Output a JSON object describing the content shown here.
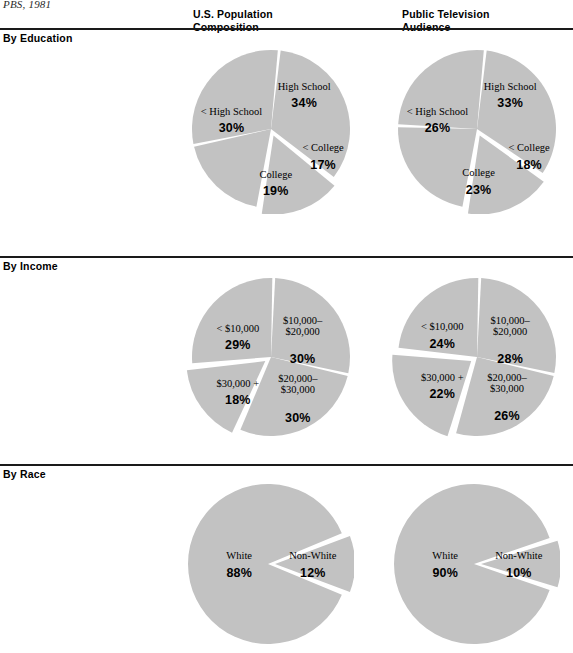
{
  "source_note": "PBS, 1981",
  "columns": [
    {
      "id": "us-population",
      "label": "U.S. Population\nComposition"
    },
    {
      "id": "public-tv",
      "label": "Public Television\nAudience"
    }
  ],
  "sections": [
    {
      "id": "education",
      "title": "By Education"
    },
    {
      "id": "income",
      "title": "By Income"
    },
    {
      "id": "race",
      "title": "By Race"
    }
  ],
  "colors": {
    "slice_fill": "#c2c2c2",
    "slice_gap": "#ffffff",
    "rule": "#1a1a1a",
    "text": "#000000",
    "background": "#ffffff"
  },
  "chart_data": [
    {
      "id": "education-us-population",
      "type": "pie",
      "section": "By Education",
      "column": "U.S. Population Composition",
      "labels": [
        "High School",
        "< College",
        "College",
        "< High School"
      ],
      "values": [
        34,
        17,
        19,
        30
      ],
      "value_labels": [
        "34%",
        "17%",
        "19%",
        "30%"
      ],
      "exploded": [
        false,
        true,
        false,
        false
      ],
      "start_angle": -84,
      "units": "percent"
    },
    {
      "id": "education-public-tv",
      "type": "pie",
      "section": "By Education",
      "column": "Public Television Audience",
      "labels": [
        "High School",
        "< College",
        "College",
        "< High School"
      ],
      "values": [
        33,
        18,
        23,
        26
      ],
      "value_labels": [
        "33%",
        "18%",
        "23%",
        "26%"
      ],
      "exploded": [
        false,
        true,
        false,
        false
      ],
      "start_angle": -84,
      "units": "percent"
    },
    {
      "id": "income-us-population",
      "type": "pie",
      "section": "By Income",
      "column": "U.S. Population Composition",
      "labels": [
        "$10,000–\n$20,000",
        "$20,000–\n$30,000",
        "$30,000 +",
        "< $10,000"
      ],
      "values": [
        30,
        30,
        18,
        29
      ],
      "value_labels": [
        "30%",
        "30%",
        "18%",
        "29%"
      ],
      "exploded": [
        false,
        false,
        true,
        false
      ],
      "start_angle": -88,
      "units": "percent"
    },
    {
      "id": "income-public-tv",
      "type": "pie",
      "section": "By Income",
      "column": "Public Television Audience",
      "labels": [
        "$10,000–\n$20,000",
        "$20,000–\n$30,000",
        "$30,000 +",
        "< $10,000"
      ],
      "values": [
        28,
        26,
        22,
        24
      ],
      "value_labels": [
        "28%",
        "26%",
        "22%",
        "24%"
      ],
      "exploded": [
        false,
        false,
        true,
        false
      ],
      "start_angle": -88,
      "units": "percent"
    },
    {
      "id": "race-us-population",
      "type": "pie",
      "section": "By Race",
      "column": "U.S. Population Composition",
      "labels": [
        "Non-White",
        "White"
      ],
      "values": [
        12,
        88
      ],
      "value_labels": [
        "12%",
        "88%"
      ],
      "exploded": [
        true,
        false
      ],
      "start_angle": -21.6,
      "units": "percent"
    },
    {
      "id": "race-public-tv",
      "type": "pie",
      "section": "By Race",
      "column": "Public Television Audience",
      "labels": [
        "Non-White",
        "White"
      ],
      "values": [
        10,
        90
      ],
      "value_labels": [
        "10%",
        "90%"
      ],
      "exploded": [
        true,
        false
      ],
      "start_angle": -18,
      "units": "percent"
    }
  ],
  "label_positions": {
    "education-us-population": [
      {
        "nx": 0.42,
        "ny": -0.5,
        "px": 0.42,
        "py": -0.28
      },
      {
        "nx": 0.66,
        "ny": 0.28,
        "px": 0.66,
        "py": 0.5
      },
      {
        "nx": 0.06,
        "ny": 0.62,
        "px": 0.06,
        "py": 0.84
      },
      {
        "nx": -0.5,
        "ny": -0.18,
        "px": -0.5,
        "py": 0.04
      }
    ],
    "education-public-tv": [
      {
        "nx": 0.42,
        "ny": -0.5,
        "px": 0.42,
        "py": -0.28
      },
      {
        "nx": 0.66,
        "ny": 0.28,
        "px": 0.66,
        "py": 0.5
      },
      {
        "nx": 0.02,
        "ny": 0.6,
        "px": 0.02,
        "py": 0.82
      },
      {
        "nx": -0.5,
        "ny": -0.18,
        "px": -0.5,
        "py": 0.04
      }
    ],
    "income-us-population": [
      {
        "nx": 0.4,
        "ny": -0.42,
        "px": 0.4,
        "py": -0.06
      },
      {
        "nx": 0.34,
        "ny": 0.32,
        "px": 0.34,
        "py": 0.68
      },
      {
        "nx": -0.42,
        "ny": 0.38,
        "px": -0.42,
        "py": 0.6
      },
      {
        "nx": -0.42,
        "ny": -0.32,
        "px": -0.42,
        "py": -0.1
      }
    ],
    "income-public-tv": [
      {
        "nx": 0.42,
        "ny": -0.42,
        "px": 0.42,
        "py": -0.06
      },
      {
        "nx": 0.38,
        "ny": 0.3,
        "px": 0.38,
        "py": 0.66
      },
      {
        "nx": -0.44,
        "ny": 0.3,
        "px": -0.44,
        "py": 0.52
      },
      {
        "nx": -0.44,
        "ny": -0.34,
        "px": -0.44,
        "py": -0.12
      }
    ],
    "race-us-population": [
      {
        "nx": 0.56,
        "ny": -0.06,
        "px": 0.56,
        "py": 0.16
      },
      {
        "nx": -0.36,
        "ny": -0.06,
        "px": -0.36,
        "py": 0.16
      }
    ],
    "race-public-tv": [
      {
        "nx": 0.56,
        "ny": -0.06,
        "px": 0.56,
        "py": 0.16
      },
      {
        "nx": -0.36,
        "ny": -0.06,
        "px": -0.36,
        "py": 0.16
      }
    ]
  }
}
